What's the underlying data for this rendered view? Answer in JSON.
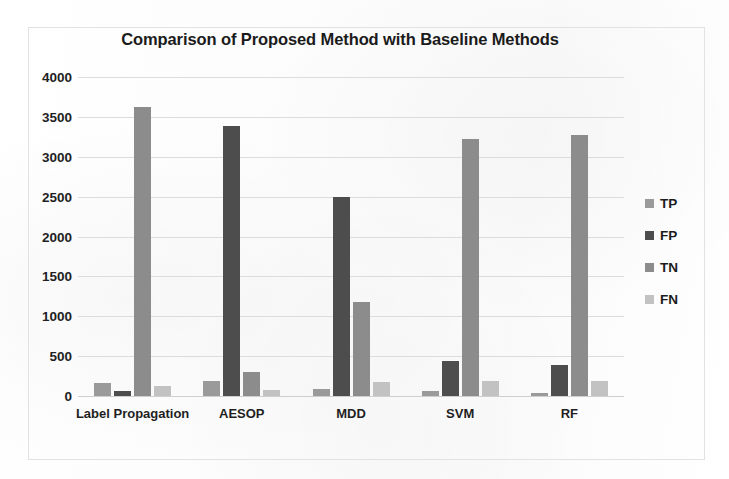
{
  "chart_data": {
    "type": "bar",
    "title": "Comparison of Proposed Method with Baseline Methods",
    "xlabel": "",
    "ylabel": "",
    "categories": [
      "Label Propagation",
      "AESOP",
      "MDD",
      "SVM",
      "RF"
    ],
    "series": [
      {
        "name": "TP",
        "color": "#9a9a9a",
        "values": [
          160,
          190,
          90,
          60,
          40
        ]
      },
      {
        "name": "FP",
        "color": "#4d4d4d",
        "values": [
          65,
          3380,
          2490,
          440,
          390
        ]
      },
      {
        "name": "TN",
        "color": "#8c8c8c",
        "values": [
          3620,
          300,
          1180,
          3220,
          3270
        ]
      },
      {
        "name": "FN",
        "color": "#c2c2c2",
        "values": [
          120,
          70,
          180,
          190,
          190
        ]
      }
    ],
    "ylim": [
      0,
      4000
    ],
    "ytick_values": [
      4000,
      3500,
      3000,
      2500,
      2000,
      1500,
      1000,
      500,
      0
    ],
    "ytick_labels": [
      "4000",
      "3500",
      "3000",
      "2500",
      "2000",
      "1500",
      "1000",
      "500",
      "0"
    ],
    "grid": true,
    "legend_position": "right",
    "legend_entries": [
      "TP",
      "FP",
      "TN",
      "FN"
    ]
  }
}
